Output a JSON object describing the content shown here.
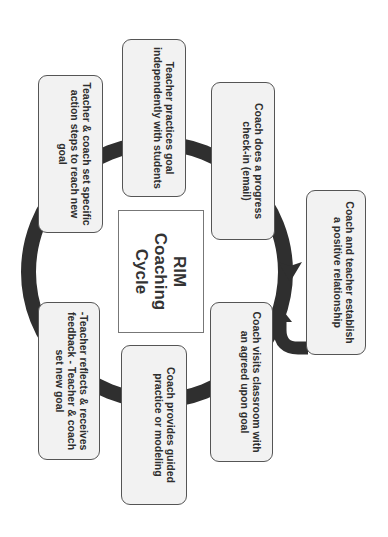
{
  "diagram": {
    "title_lines": [
      "RIM",
      "Coaching",
      "Cycle"
    ],
    "orientation": "rotated 90 degrees clockwise",
    "colors": {
      "ring": "#2f2f2f",
      "box_fill": "#f2f2f2",
      "box_border": "#555555",
      "text": "#2e2e2e"
    },
    "entry_step": {
      "label": "Coach and teacher establish a positive relationship"
    },
    "cycle_steps": [
      {
        "id": "visit",
        "label": "Coach visits classroom with an agreed upon goal"
      },
      {
        "id": "guided",
        "label": "Coach provides guided practice or modeling"
      },
      {
        "id": "reflect",
        "label": "-Teacher reflects & receives feedback - Teacher & coach set new goal"
      },
      {
        "id": "action",
        "label": "Teacher & coach set specific action steps to reach new goal"
      },
      {
        "id": "practice",
        "label": "Teacher practices goal independently with students"
      },
      {
        "id": "checkin",
        "label": "Coach does a progress check-in (email)"
      }
    ]
  }
}
